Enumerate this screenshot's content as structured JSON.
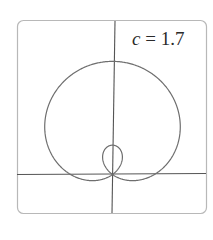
{
  "chart_data": {
    "type": "line",
    "subtype": "polar",
    "title": "",
    "annotation": {
      "variable": "c",
      "equals": " = ",
      "value": "1.7"
    },
    "equation": "r = 1 + c sin(theta)",
    "parameter_c": 1.7,
    "theta_range": [
      0,
      6.2832
    ],
    "xlabel": "",
    "ylabel": "",
    "xlim": [
      -2.3,
      2.3
    ],
    "ylim": [
      -0.95,
      3.7
    ],
    "grid": false,
    "legend": null,
    "axes_through_origin": true,
    "features": {
      "outer_loop_max_r": 2.7,
      "inner_loop_max_r": 0.7
    }
  },
  "style": {
    "curve_color": "#6e6e6e",
    "axis_color": "#555555",
    "frame_color": "#b8b8b8",
    "background": "#ffffff"
  }
}
